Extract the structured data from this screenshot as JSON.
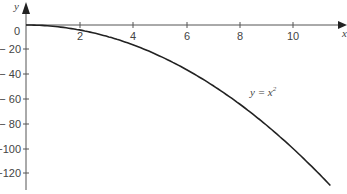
{
  "chart_data": {
    "type": "line",
    "title": "",
    "xlabel": "x",
    "ylabel": "y",
    "annotation": "y = x²",
    "x_ticks": [
      "2",
      "4",
      "6",
      "8",
      "10"
    ],
    "y_ticks": [
      "0",
      "-20",
      "-40",
      "-60",
      "-80",
      "-100",
      "-120"
    ],
    "xlim": [
      0,
      11.5
    ],
    "ylim": [
      -130,
      0
    ],
    "grid": false,
    "series": [
      {
        "name": "curve",
        "x": [
          0,
          1,
          2,
          3,
          4,
          5,
          6,
          7,
          8,
          9,
          10,
          11,
          11.4
        ],
        "y": [
          0,
          -1,
          -4,
          -9,
          -16,
          -25,
          -36,
          -49,
          -64,
          -81,
          -100,
          -121,
          -130
        ]
      }
    ]
  },
  "labels": {
    "y_axis": "y",
    "x_axis": "x",
    "curve_label": "y = x",
    "curve_label_sup": "2",
    "xt": [
      "2",
      "4",
      "6",
      "8",
      "10"
    ],
    "yt": [
      "0",
      "− 20",
      "− 40",
      "− 60",
      "− 80",
      "−100",
      "−120"
    ]
  }
}
